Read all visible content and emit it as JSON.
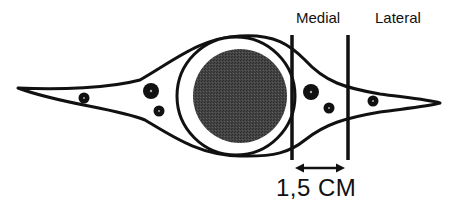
{
  "diagram": {
    "type": "anatomical cross-section schematic",
    "labels": {
      "medial": "Medial",
      "lateral": "Lateral",
      "measurement": "1,5 CM"
    },
    "colors": {
      "stroke": "#111111",
      "core_fill": "#3a3a3a",
      "background": "#ffffff"
    },
    "elements": {
      "outer_envelope": "spindle-shaped outline tapering left and right",
      "ring_circle": "white circle with black outline surrounding the core",
      "core_circle": "dark filled circle",
      "boundary_lines": [
        "medial boundary line",
        "lateral boundary line"
      ],
      "measurement_arrow": "double-headed arrow between boundary lines",
      "dots": [
        {
          "side": "left",
          "size": "small"
        },
        {
          "side": "left",
          "size": "large"
        },
        {
          "side": "left",
          "size": "small"
        },
        {
          "side": "medial zone",
          "size": "large"
        },
        {
          "side": "medial zone",
          "size": "small"
        },
        {
          "side": "lateral zone",
          "size": "small"
        }
      ]
    }
  }
}
